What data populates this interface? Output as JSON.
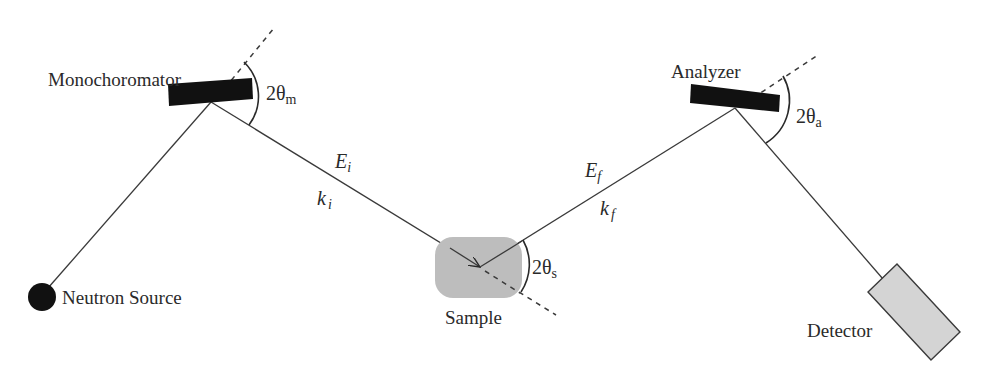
{
  "diagram": {
    "components": {
      "source": {
        "label": "Neutron Source",
        "color": "#111111"
      },
      "monochromator": {
        "label": "Monochoromator",
        "angle_label": "2θ",
        "angle_sub": "m",
        "color": "#111111"
      },
      "sample": {
        "label": "Sample",
        "angle_label": "2θ",
        "angle_sub": "s",
        "color": "#bdbdbd"
      },
      "analyzer": {
        "label": "Analyzer",
        "angle_label": "2θ",
        "angle_sub": "a",
        "color": "#111111"
      },
      "detector": {
        "label": "Detector",
        "color": "#d4d4d4"
      }
    },
    "beams": {
      "incident": {
        "energy": "E",
        "energy_sub": "i",
        "wavevector": "k",
        "wavevector_sub": "i"
      },
      "final": {
        "energy": "E",
        "energy_sub": "f",
        "wavevector": "k",
        "wavevector_sub": "f"
      }
    }
  }
}
